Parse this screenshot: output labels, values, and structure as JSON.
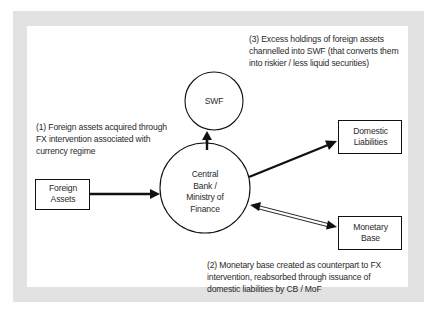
{
  "diagram": {
    "nodes": {
      "swf": {
        "shape": "circle",
        "lines": [
          "SWF"
        ]
      },
      "central_bank": {
        "shape": "circle",
        "lines": [
          "Central",
          "Bank /",
          "Ministry of",
          "Finance"
        ]
      },
      "foreign_assets": {
        "shape": "box",
        "lines": [
          "Foreign",
          "Assets"
        ]
      },
      "domestic_liabilities": {
        "shape": "box",
        "lines": [
          "Domestic",
          "Liabilities"
        ]
      },
      "monetary_base": {
        "shape": "box",
        "lines": [
          "Monetary",
          "Base"
        ]
      }
    },
    "edges": [
      {
        "from": "foreign_assets",
        "to": "central_bank",
        "style": "thick",
        "direction": "forward"
      },
      {
        "from": "central_bank",
        "to": "swf",
        "style": "thick",
        "direction": "forward"
      },
      {
        "from": "central_bank",
        "to": "domestic_liabilities",
        "style": "thick",
        "direction": "forward"
      },
      {
        "from": "central_bank",
        "to": "monetary_base",
        "style": "double-line",
        "direction": "both"
      }
    ],
    "annotations": {
      "note1": [
        "(1) Foreign assets acquired through",
        "FX intervention associated with",
        "currency regime"
      ],
      "note2": [
        "(2) Monetary base created as counterpart to FX",
        "intervention, reabsorbed through issuance of",
        "domestic liabilities by CB / MoF"
      ],
      "note3": [
        "(3) Excess holdings of foreign assets",
        "channelled into SWF (that converts them",
        "into riskier / less liquid securities)"
      ]
    },
    "colors": {
      "frame": "#e2e2e2",
      "panel": "#ffffff",
      "stroke": "#111111",
      "text": "#2a2a2a"
    }
  }
}
